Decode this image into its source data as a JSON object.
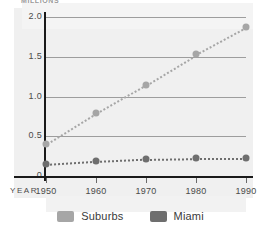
{
  "chart_data": {
    "type": "line",
    "title": "",
    "ylabel": "MILLIONS",
    "xlabel": "YEAR",
    "categories": [
      "1950",
      "1960",
      "1970",
      "1980",
      "1990"
    ],
    "x": [
      1950,
      1960,
      1970,
      1980,
      1990
    ],
    "ylim": [
      0,
      2.0
    ],
    "yticks": [
      "2.0",
      "1.5",
      "1.0",
      "0.5",
      "0"
    ],
    "ytick_values": [
      2.0,
      1.5,
      1.0,
      0.5,
      0
    ],
    "grid": true,
    "legend_position": "bottom",
    "series": [
      {
        "name": "Suburbs",
        "color": "#a6a6a6",
        "values": [
          0.4,
          0.79,
          1.15,
          1.53,
          1.87
        ]
      },
      {
        "name": "Miami",
        "color": "#6e6e6e",
        "values": [
          0.15,
          0.19,
          0.22,
          0.23,
          0.23
        ]
      }
    ]
  },
  "legend": {
    "items": [
      {
        "label": "Suburbs",
        "color": "#a6a6a6"
      },
      {
        "label": "Miami",
        "color": "#6e6e6e"
      }
    ]
  }
}
